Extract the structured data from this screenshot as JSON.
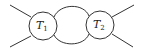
{
  "diagram": {
    "type": "two-vertex loop diagram",
    "stroke_color": "#333333",
    "background": "#ffffff",
    "nodes": [
      {
        "id": "T1",
        "label_main": "T",
        "label_sub": "1",
        "cx": 43,
        "cy": 26,
        "r": 14
      },
      {
        "id": "T2",
        "label_main": "T",
        "label_sub": "2",
        "cx": 100,
        "cy": 25,
        "r": 14
      }
    ],
    "internal_lines": [
      {
        "id": "top-arc",
        "from": "T1",
        "to": "T2"
      },
      {
        "id": "bottom-arc",
        "from": "T1",
        "to": "T2"
      }
    ],
    "external_lines": [
      {
        "id": "ext-left-upper",
        "attached_to": "T1"
      },
      {
        "id": "ext-left-lower",
        "attached_to": "T1"
      },
      {
        "id": "ext-right-upper",
        "attached_to": "T2"
      },
      {
        "id": "ext-right-lower",
        "attached_to": "T2"
      }
    ]
  }
}
